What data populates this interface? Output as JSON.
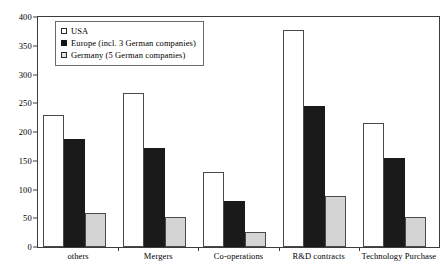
{
  "chart_data": {
    "type": "bar",
    "title": "",
    "subtitle": "",
    "xlabel": "",
    "ylabel": "",
    "ylim": [
      0,
      400
    ],
    "yticks": [
      0,
      50,
      100,
      150,
      200,
      250,
      300,
      350,
      400
    ],
    "grid": false,
    "legend_position": "upper-left-inside",
    "categories": [
      "others",
      "Mergers",
      "Co-operations",
      "R&D contracts",
      "Technology Purchase"
    ],
    "series": [
      {
        "name": "USA",
        "color": "#ffffff",
        "values": [
          229,
          267,
          130,
          377,
          215
        ]
      },
      {
        "name": "Europe (incl. 3 German companies)",
        "color": "#1a1a1a",
        "values": [
          188,
          173,
          80,
          245,
          155
        ]
      },
      {
        "name": "Germany (5 German companies)",
        "color": "#d4d4d4",
        "values": [
          59,
          53,
          26,
          88,
          53
        ]
      }
    ]
  },
  "colors": {
    "axis": "#3c3c3c",
    "bar_outline": "#4a4a4a",
    "legend_border": "#6a6a6a",
    "background": "#ffffff"
  }
}
